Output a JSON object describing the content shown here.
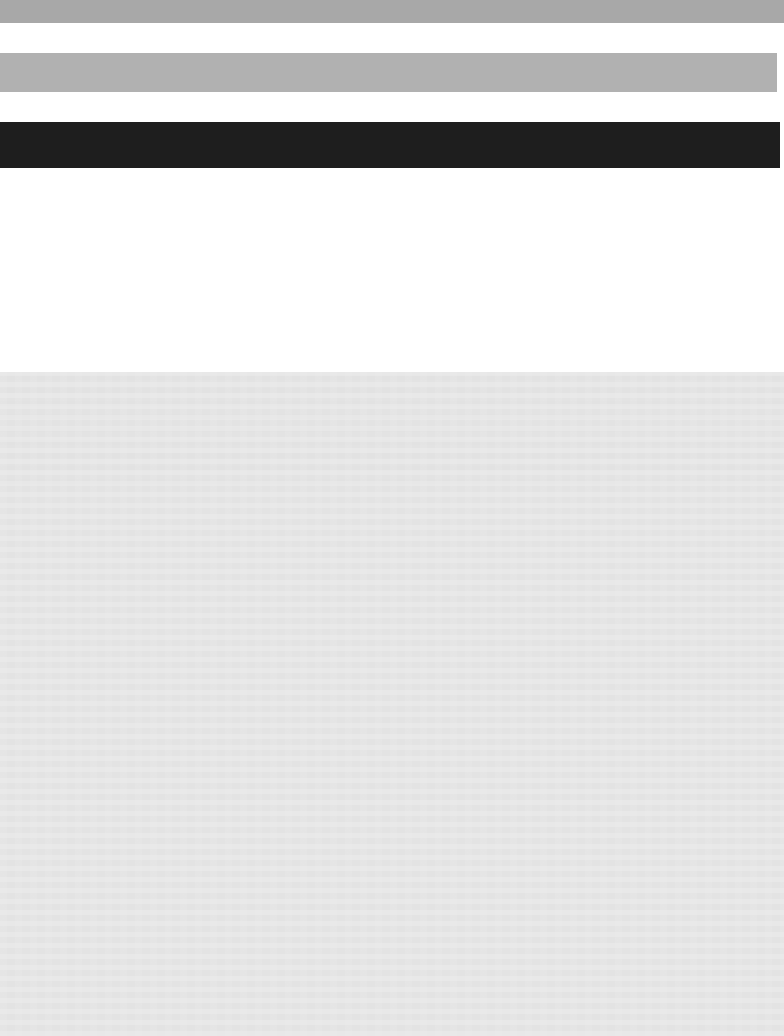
{
  "page": {
    "title": "",
    "width": 784,
    "height": 1036,
    "background_color": "#ffffff",
    "state": "blank",
    "note": ""
  },
  "header_strip": {
    "label": "",
    "color": "#a8a8a8",
    "top": 0,
    "height": 23
  },
  "toolbar_strip": {
    "label": "",
    "color": "#b1b1b1",
    "top": 53,
    "height": 39
  },
  "titlebar_strip": {
    "label": "",
    "color": "#1e1e1e",
    "top": 122,
    "height": 46
  },
  "content_gap": {
    "label": "",
    "color": "#ffffff",
    "top": 168,
    "height": 204
  },
  "content_panel": {
    "label": "",
    "color": "#e4e4e4",
    "top": 372,
    "height": 664
  },
  "colors": {
    "page_background": "#ffffff",
    "header_gray": "#a8a8a8",
    "toolbar_gray": "#b1b1b1",
    "titlebar_dark": "#1e1e1e",
    "panel_gray": "#e4e4e4"
  }
}
